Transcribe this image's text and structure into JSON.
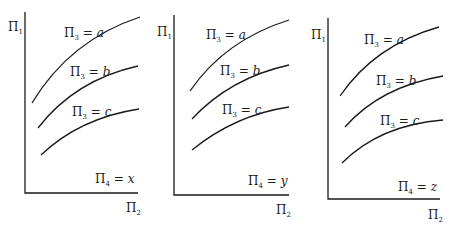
{
  "diagram": {
    "panels": [
      {
        "y_axis_label": {
          "sym": "Π",
          "sub": "1"
        },
        "x_axis_label": {
          "sym": "Π",
          "sub": "2"
        },
        "condition": {
          "sym": "Π",
          "sub": "4",
          "eq": " = ",
          "val": "x"
        },
        "curves": [
          {
            "sym": "Π",
            "sub": "3",
            "eq": " = ",
            "val": "a"
          },
          {
            "sym": "Π",
            "sub": "3",
            "eq": " = ",
            "val": "b"
          },
          {
            "sym": "Π",
            "sub": "3",
            "eq": " = ",
            "val": "c"
          }
        ]
      },
      {
        "y_axis_label": {
          "sym": "Π",
          "sub": "1"
        },
        "x_axis_label": {
          "sym": "Π",
          "sub": "2"
        },
        "condition": {
          "sym": "Π",
          "sub": "4",
          "eq": " = ",
          "val": "y"
        },
        "curves": [
          {
            "sym": "Π",
            "sub": "3",
            "eq": " = ",
            "val": "a"
          },
          {
            "sym": "Π",
            "sub": "3",
            "eq": " = ",
            "val": "b"
          },
          {
            "sym": "Π",
            "sub": "3",
            "eq": " = ",
            "val": "c"
          }
        ]
      },
      {
        "y_axis_label": {
          "sym": "Π",
          "sub": "1"
        },
        "x_axis_label": {
          "sym": "Π",
          "sub": "2"
        },
        "condition": {
          "sym": "Π",
          "sub": "4",
          "eq": " = ",
          "val": "z"
        },
        "curves": [
          {
            "sym": "Π",
            "sub": "3",
            "eq": " = ",
            "val": "a"
          },
          {
            "sym": "Π",
            "sub": "3",
            "eq": " = ",
            "val": "b"
          },
          {
            "sym": "Π",
            "sub": "3",
            "eq": " = ",
            "val": "c"
          }
        ]
      }
    ]
  }
}
